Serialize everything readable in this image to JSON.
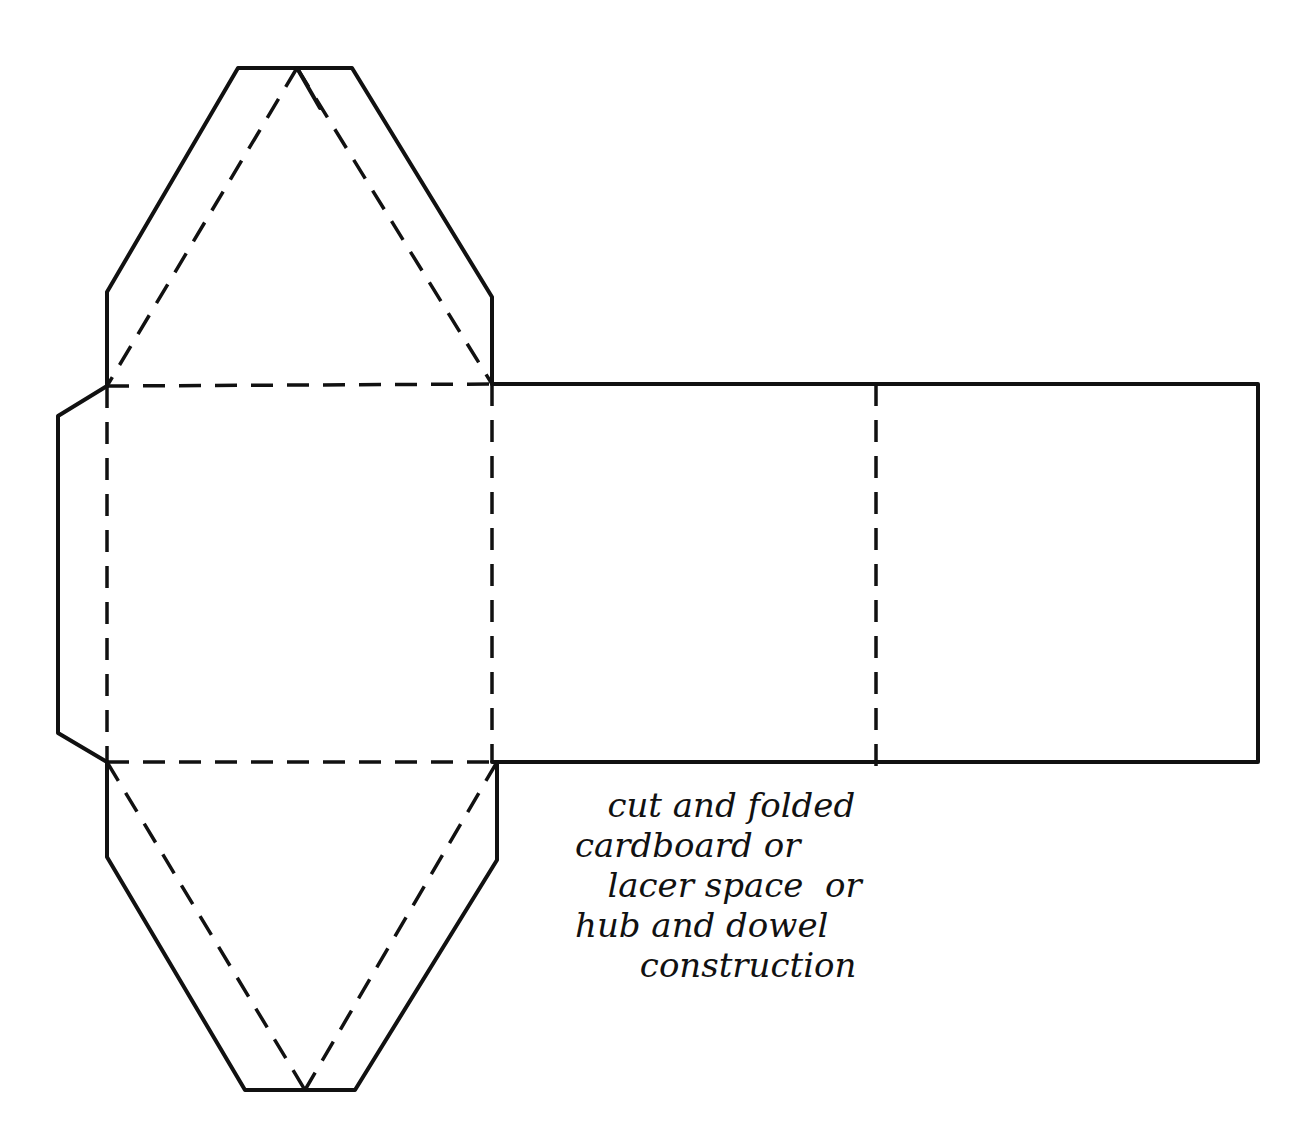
{
  "diagram": {
    "legend": {
      "solid_line": "cut line",
      "dashed_line": "fold line"
    },
    "note_lines": [
      "   cut and folded",
      "cardboard or",
      "   lacer space  or",
      "hub and dowel",
      "      construction"
    ]
  }
}
